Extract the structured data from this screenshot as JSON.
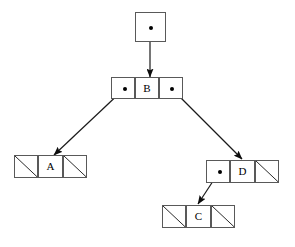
{
  "diagram": {
    "background_color": "#ffffff",
    "stroke_color": "#595959",
    "edge_color": "#1a1a1a",
    "text_color": "#000000",
    "root": {
      "label": "root-pointer",
      "cell_kind": "pointer",
      "x": 135,
      "y": 12,
      "w": 31,
      "h": 30,
      "dot": {
        "cx": 150,
        "cy": 27
      }
    },
    "nodes": [
      {
        "id": "B",
        "value": "B",
        "x": 111,
        "y": 77,
        "w": 72,
        "h": 22,
        "cell_width": 24,
        "left": {
          "kind": "pointer",
          "target": "A",
          "dot": {
            "cx": 124,
            "cy": 88
          }
        },
        "right": {
          "kind": "pointer",
          "target": "D",
          "dot": {
            "cx": 171,
            "cy": 88
          }
        }
      },
      {
        "id": "A",
        "value": "A",
        "x": 14,
        "y": 155,
        "w": 73,
        "h": 23,
        "cell_width": 24.3,
        "left": {
          "kind": "null",
          "target": null
        },
        "right": {
          "kind": "null",
          "target": null
        }
      },
      {
        "id": "D",
        "value": "D",
        "x": 206,
        "y": 160,
        "w": 73,
        "h": 23,
        "cell_width": 24.3,
        "left": {
          "kind": "pointer",
          "target": "C",
          "dot": {
            "cx": 219,
            "cy": 171
          }
        },
        "right": {
          "kind": "null",
          "target": null
        }
      },
      {
        "id": "C",
        "value": "C",
        "x": 162,
        "y": 205,
        "w": 73,
        "h": 23,
        "cell_width": 24.3,
        "left": {
          "kind": "null",
          "target": null
        },
        "right": {
          "kind": "null",
          "target": null
        }
      }
    ],
    "edges": [
      {
        "id": "root-to-B",
        "from": "root-pointer",
        "to": "B",
        "x1": 150,
        "y1": 31,
        "x2": 150,
        "y2": 77
      },
      {
        "id": "B-left-to-A",
        "from": "B",
        "to": "A",
        "x1": 124,
        "y1": 89,
        "x2": 54,
        "y2": 155
      },
      {
        "id": "B-right-to-D",
        "from": "B",
        "to": "D",
        "x1": 172,
        "y1": 89,
        "x2": 242,
        "y2": 159
      },
      {
        "id": "D-left-to-C",
        "from": "D",
        "to": "C",
        "x1": 219,
        "y1": 172,
        "x2": 198,
        "y2": 204
      }
    ]
  }
}
